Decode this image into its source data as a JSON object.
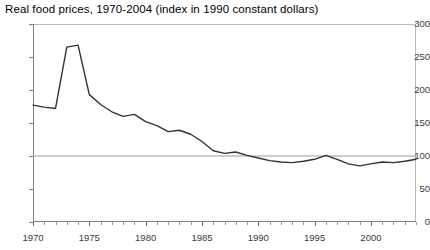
{
  "chart_data": {
    "type": "line",
    "title": "Real food prices, 1970-2004 (index in 1990 constant dollars)",
    "xlabel": "",
    "ylabel": "",
    "xlim": [
      1970,
      2004
    ],
    "ylim": [
      0,
      300
    ],
    "yticks": [
      0,
      50,
      100,
      150,
      200,
      250,
      300
    ],
    "xticks": [
      1970,
      1975,
      1980,
      1985,
      1990,
      1995,
      2000
    ],
    "grid": false,
    "reference_line": {
      "value": 100,
      "label": "100"
    },
    "legend": "none",
    "x": [
      1970,
      1971,
      1972,
      1973,
      1974,
      1975,
      1976,
      1977,
      1978,
      1979,
      1980,
      1981,
      1982,
      1983,
      1984,
      1985,
      1986,
      1987,
      1988,
      1989,
      1990,
      1991,
      1992,
      1993,
      1994,
      1995,
      1996,
      1997,
      1998,
      1999,
      2000,
      2001,
      2002,
      2003,
      2004
    ],
    "series": [
      {
        "name": "Real food price index",
        "values": [
          177,
          174,
          172,
          265,
          268,
          193,
          178,
          167,
          160,
          163,
          152,
          146,
          137,
          139,
          133,
          122,
          108,
          104,
          106,
          101,
          97,
          93,
          91,
          90,
          92,
          95,
          101,
          95,
          88,
          85,
          88,
          91,
          90,
          92,
          95
        ]
      }
    ]
  }
}
